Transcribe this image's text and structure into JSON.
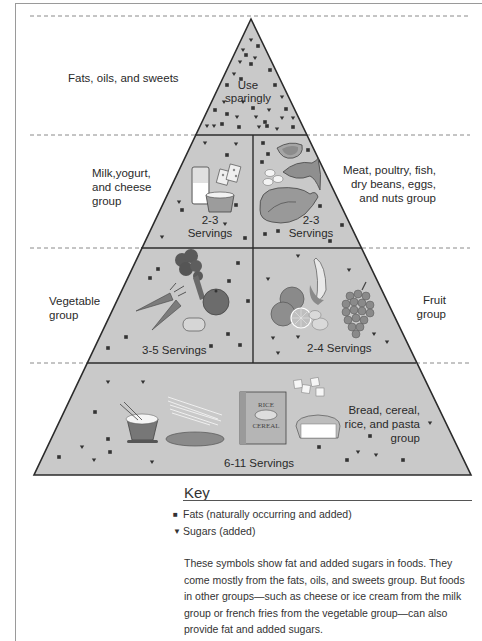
{
  "diagram": {
    "type": "food-guide-pyramid",
    "colors": {
      "fill": "#c9c9c9",
      "outline": "#2b2b2b",
      "dash": "#8a8a8a",
      "symbol": "#333333"
    },
    "tiers": [
      {
        "id": "fats",
        "group_label": "Fats, oils, and sweets",
        "inner_label_line1": "Use",
        "inner_label_line2": "sparingly"
      },
      {
        "id": "milk",
        "group_label_line1": "Milk,yogurt,",
        "group_label_line2": "and cheese",
        "group_label_line3": "group",
        "servings_line1": "2-3",
        "servings_line2": "Servings",
        "foods": [
          "milk glass",
          "yogurt cup",
          "cheese slices"
        ]
      },
      {
        "id": "meat",
        "group_label_line1": "Meat, poultry, fish,",
        "group_label_line2": "dry beans, eggs,",
        "group_label_line3": "and nuts group",
        "servings_line1": "2-3",
        "servings_line2": "Servings",
        "foods": [
          "steak",
          "fish",
          "eggs",
          "chicken"
        ]
      },
      {
        "id": "vegetable",
        "group_label_line1": "Vegetable",
        "group_label_line2": "group",
        "servings": "3-5 Servings",
        "foods": [
          "broccoli",
          "carrots",
          "tomato",
          "potato"
        ]
      },
      {
        "id": "fruit",
        "group_label_line1": "Fruit",
        "group_label_line2": "group",
        "servings": "2-4 Servings",
        "foods": [
          "oranges",
          "lemon",
          "banana",
          "grapes"
        ]
      },
      {
        "id": "bread",
        "group_label_line1": "Bread, cereal,",
        "group_label_line2": "rice, and pasta",
        "group_label_line3": "group",
        "servings": "6-11 Servings",
        "cereal_box_line1": "RICE",
        "cereal_box_line2": "CEREAL",
        "foods": [
          "rice bowl",
          "pasta",
          "bread loaf",
          "cereal box",
          "crackers",
          "loaf of bread"
        ]
      }
    ]
  },
  "key": {
    "title": "Key",
    "items": [
      {
        "symbol": "■",
        "label": "Fats (naturally occurring and added)"
      },
      {
        "symbol": "▼",
        "label": "Sugars (added)"
      }
    ],
    "description": "These symbols show fat and added sugars in foods. They come mostly from the fats, oils, and sweets group. But foods in other groups—such as cheese or ice cream from the milk group or french fries from the vegetable group—can also provide fat and added sugars."
  }
}
